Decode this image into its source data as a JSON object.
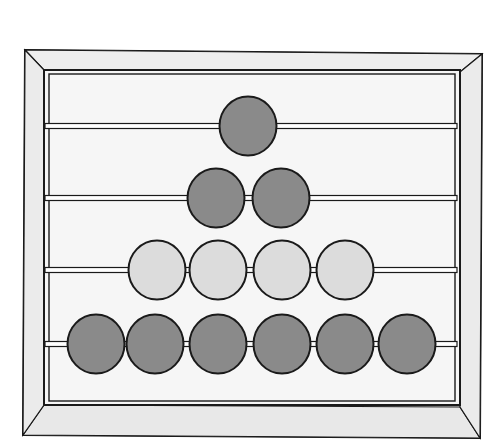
{
  "illustration": {
    "subject": "abacus",
    "rows": [
      {
        "bead_count": 1,
        "bead_color": "dark",
        "y": 126,
        "bead_centers_x": [
          248
        ]
      },
      {
        "bead_count": 2,
        "bead_color": "dark",
        "y": 198,
        "bead_centers_x": [
          216,
          281
        ]
      },
      {
        "bead_count": 4,
        "bead_color": "light",
        "y": 270,
        "bead_centers_x": [
          157,
          218,
          282,
          345
        ]
      },
      {
        "bead_count": 6,
        "bead_color": "dark",
        "y": 344,
        "bead_centers_x": [
          96,
          155,
          218,
          282,
          345,
          407
        ]
      }
    ],
    "colors": {
      "dark_bead": "#8a8a8a",
      "light_bead": "#dcdcdc",
      "frame": "#ececec",
      "inner": "#f6f6f6",
      "outline": "#1a1a1a"
    }
  }
}
